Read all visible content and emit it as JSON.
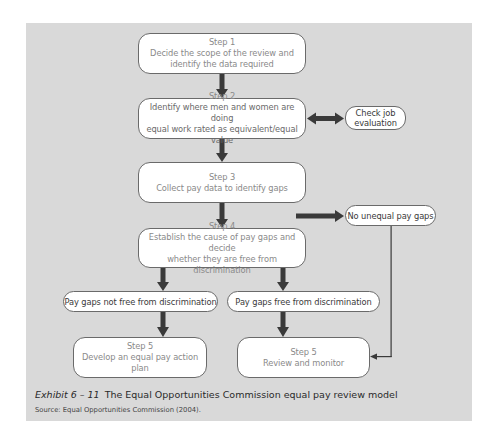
{
  "diagram": {
    "steps": [
      {
        "id": "step1",
        "heading": "Step 1",
        "line1": "Decide the scope of the review and",
        "line2": "identify the data required"
      },
      {
        "id": "step2",
        "heading": "Step 2",
        "line1": "Identify where men and women are doing",
        "line2": "equal work rated as equivalent/equal value"
      },
      {
        "id": "step3",
        "heading": "Step 3",
        "line1": "Collect pay data to identify gaps",
        "line2": ""
      },
      {
        "id": "step4",
        "heading": "Step 4",
        "line1": "Establish the cause of pay gaps and decide",
        "line2": "whether they are free from discrimination"
      },
      {
        "id": "step5a",
        "heading": "Step 5",
        "line1": "Develop an equal pay action plan",
        "line2": ""
      },
      {
        "id": "step5b",
        "heading": "Step 5",
        "line1": "Review and monitor",
        "line2": ""
      }
    ],
    "side_nodes": {
      "check_job": {
        "line1": "Check job",
        "line2": "evaluation"
      },
      "no_gaps": "No unequal pay gaps",
      "not_free": "Pay gaps not free from discrimination",
      "free": "Pay gaps free from discrimination"
    },
    "colors": {
      "panel": "#d9d9d9",
      "box_fill": "#ffffff",
      "arrow": "#3a3a3a"
    }
  },
  "caption": {
    "exhibit": "Exhibit 6 – 11",
    "title": "The Equal Opportunities Commission equal pay review model",
    "source": "Source: Equal Opportunities Commission (2004)."
  }
}
